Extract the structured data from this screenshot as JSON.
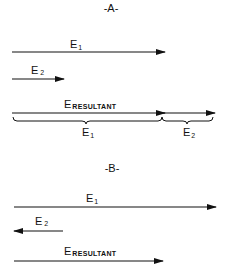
{
  "panels": [
    {
      "title": "-A-",
      "vectors": [
        {
          "name": "E",
          "sub": "1",
          "direction": "right"
        },
        {
          "name": "E",
          "sub": "2",
          "direction": "right"
        },
        {
          "name": "E",
          "sub": "RESULTANT",
          "direction": "right"
        }
      ],
      "braces": [
        {
          "name": "E",
          "sub": "1"
        },
        {
          "name": "E",
          "sub": "2"
        }
      ]
    },
    {
      "title": "-B-",
      "vectors": [
        {
          "name": "E",
          "sub": "1",
          "direction": "right"
        },
        {
          "name": "E",
          "sub": "2",
          "direction": "left"
        },
        {
          "name": "E",
          "sub": "RESULTANT",
          "direction": "right"
        }
      ]
    }
  ],
  "colors": {
    "ink": "#111111",
    "background": "#ffffff"
  }
}
